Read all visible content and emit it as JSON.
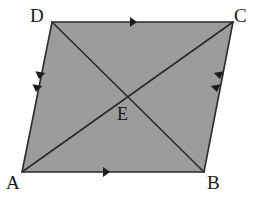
{
  "figure": {
    "kind": "geometry-diagram",
    "shape": "parallelogram",
    "background_color": "#ffffff",
    "fill_color": "#9c9c9c",
    "stroke_color": "#2a2a2a",
    "stroke_width": 1.6,
    "vertices": [
      {
        "name": "D",
        "x": 52,
        "y": 22,
        "label": "D",
        "label_x": 30,
        "label_y": 6
      },
      {
        "name": "C",
        "x": 233,
        "y": 22,
        "label": "C",
        "label_x": 234,
        "label_y": 6
      },
      {
        "name": "B",
        "x": 204,
        "y": 172,
        "label": "B",
        "label_x": 207,
        "label_y": 173
      },
      {
        "name": "A",
        "x": 22,
        "y": 172,
        "label": "A",
        "label_x": 6,
        "label_y": 173
      }
    ],
    "interior_points": [
      {
        "name": "E",
        "x": 128,
        "y": 98,
        "label": "E",
        "label_x": 117,
        "label_y": 105
      }
    ],
    "edges": [
      {
        "name": "DC",
        "from": "D",
        "to": "C",
        "tick_marks": 1,
        "marker": "arrowhead",
        "direction": "right"
      },
      {
        "name": "AB",
        "from": "A",
        "to": "B",
        "tick_marks": 1,
        "marker": "arrowhead",
        "direction": "right"
      },
      {
        "name": "DA",
        "from": "D",
        "to": "A",
        "tick_marks": 2,
        "marker": "arrowhead",
        "direction": "down"
      },
      {
        "name": "CB",
        "from": "C",
        "to": "B",
        "tick_marks": 2,
        "marker": "arrowhead",
        "direction": "down"
      }
    ],
    "diagonals": [
      {
        "name": "AC",
        "from": "A",
        "to": "C"
      },
      {
        "name": "DB",
        "from": "D",
        "to": "B"
      }
    ],
    "arrow_markers": [
      {
        "edge": "DC",
        "x": 137,
        "y": 22,
        "angle": 0,
        "size": 7
      },
      {
        "edge": "AB",
        "x": 110,
        "y": 172,
        "angle": 0,
        "size": 7
      },
      {
        "edge": "DA",
        "x": 39,
        "y": 79,
        "angle": 101,
        "size": 7
      },
      {
        "edge": "DA",
        "x": 36,
        "y": 92,
        "angle": 101,
        "size": 7
      },
      {
        "edge": "CB",
        "x": 220,
        "y": 79,
        "angle": 79,
        "size": 7
      },
      {
        "edge": "CB",
        "x": 217,
        "y": 92,
        "angle": 79,
        "size": 7
      }
    ]
  },
  "labels": {
    "D": "D",
    "C": "C",
    "A": "A",
    "B": "B",
    "E": "E"
  }
}
